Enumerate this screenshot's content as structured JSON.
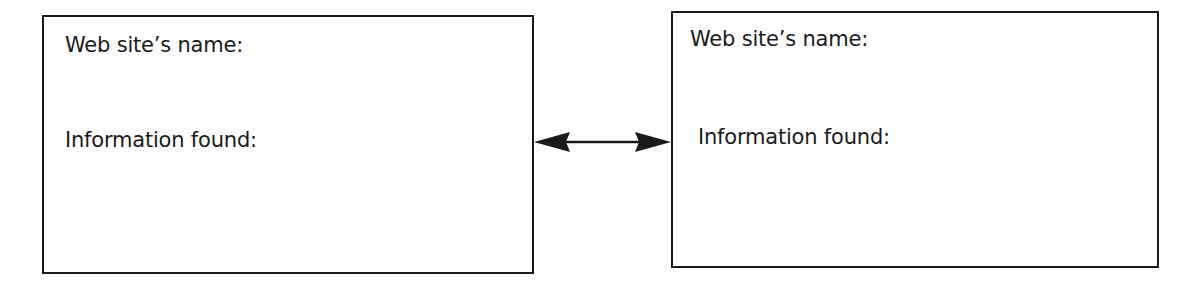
{
  "diagram": {
    "type": "two-box comparison with bidirectional arrow",
    "boxes": [
      {
        "id": "left",
        "name_label": "Web site’s name:",
        "info_label": "Information found:"
      },
      {
        "id": "right",
        "name_label": "Web site’s name:",
        "info_label": "Information found:"
      }
    ],
    "connector": {
      "kind": "double-headed-arrow",
      "from": "left",
      "to": "right"
    },
    "colors": {
      "stroke": "#1a1a1a",
      "background": "#ffffff",
      "text": "#1a1a1a"
    }
  }
}
